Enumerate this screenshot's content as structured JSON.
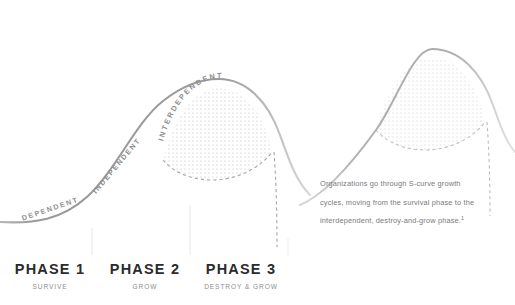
{
  "diagram": {
    "title_hidden": "",
    "curve_labels": [
      {
        "id": "dependent",
        "text": "DEPENDENT"
      },
      {
        "id": "independent",
        "text": "INDEPENDENT"
      },
      {
        "id": "interdependent",
        "text": "INTERDEPENDENT"
      }
    ],
    "phases": [
      {
        "title": "PHASE 1",
        "subtitle": "SURVIVE"
      },
      {
        "title": "PHASE 2",
        "subtitle": "GROW"
      },
      {
        "title": "PHASE 3",
        "subtitle": "DESTROY & GROW"
      }
    ],
    "caption": {
      "line1": "Organizations go through S-curve growth",
      "line2": "cycles, moving from the survival phase to the",
      "line3": "interdependent, destroy-and-grow phase.",
      "footnote_marker": "1"
    },
    "colors": {
      "background": "#ffffff",
      "curve_stroke": "#9a9a9a",
      "curve_stroke_faded": "#cfcfcf",
      "dot_fill": "#b9b9c4",
      "dashed_line": "#a9a9a9",
      "phase_divider": "#e8e8e8",
      "phase_title_text": "#2b2b2b",
      "phase_subtitle_text": "#8d8d8d",
      "caption_text": "#7a7a7a",
      "curve_label_text": "#8e8e8e"
    }
  }
}
